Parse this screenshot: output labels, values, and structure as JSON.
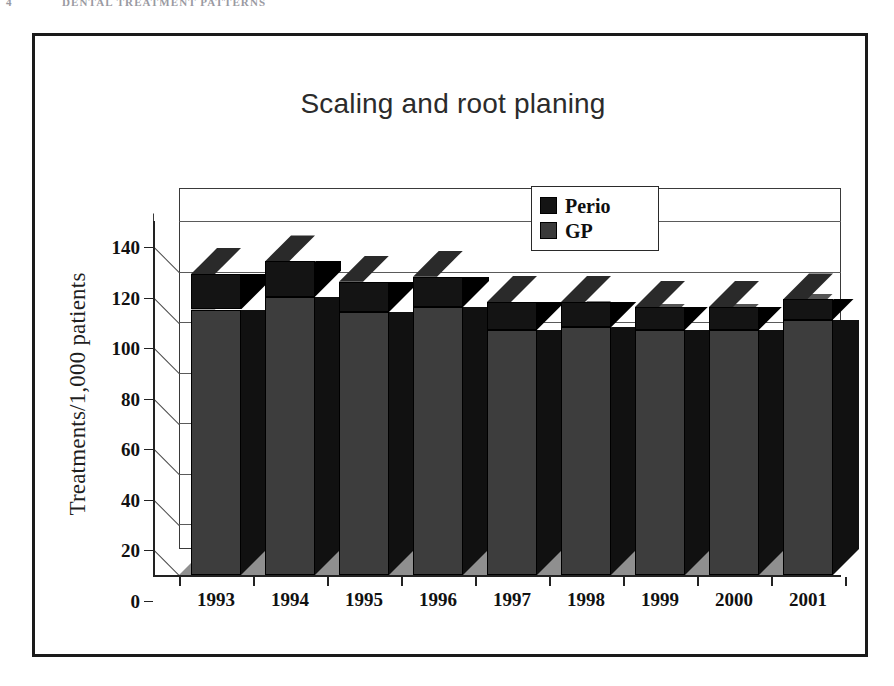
{
  "page_header": {
    "folio": "4",
    "running_title": "DENTAL TREATMENT PATTERNS"
  },
  "figure": {
    "title": "Scaling and root planing"
  },
  "legend": {
    "position": "top-right-inside-plot",
    "items": [
      {
        "label": "Perio",
        "color": "#141414",
        "name": "perio"
      },
      {
        "label": "GP",
        "color": "#3a3a3a",
        "name": "gp"
      }
    ]
  },
  "colors": {
    "perio": "#141414",
    "perio_side": "#000000",
    "perio_top": "#2a2a2a",
    "gp": "#3d3d3d",
    "gp_side": "#111111",
    "gp_top": "#555555",
    "floor": "#8f8f8f",
    "side_wall": "#ffffff",
    "frame": "#1a1a1a",
    "gridline": "#5a5a5a"
  },
  "chart_data": {
    "type": "bar",
    "subtype": "stacked-3d-column",
    "title": "Scaling and root planing",
    "xlabel": "",
    "ylabel": "Treatments/1,000 patients",
    "ylim": [
      0,
      140
    ],
    "yticks": [
      0,
      20,
      40,
      60,
      80,
      100,
      120,
      140
    ],
    "ytick_labels": [
      "0",
      "20",
      "40",
      "60",
      "80",
      "100",
      "120",
      "140"
    ],
    "grid": true,
    "legend_position": "upper right",
    "categories": [
      "1993",
      "1994",
      "1995",
      "1996",
      "1997",
      "1998",
      "1999",
      "2000",
      "2001"
    ],
    "series": [
      {
        "name": "GP",
        "values": [
          105,
          110,
          104,
          106,
          97,
          98,
          97,
          97,
          101
        ]
      },
      {
        "name": "Perio",
        "values": [
          14,
          14,
          12,
          12,
          11,
          10,
          9,
          9,
          8
        ]
      }
    ],
    "totals": [
      119,
      124,
      116,
      118,
      108,
      108,
      106,
      106,
      109
    ]
  }
}
